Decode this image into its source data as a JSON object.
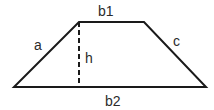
{
  "diagram": {
    "shape": "trapezoid",
    "vertices": {
      "top_left": [
        79,
        22
      ],
      "top_right": [
        144,
        22
      ],
      "bottom_right": [
        206,
        87
      ],
      "bottom_left": [
        14,
        87
      ]
    },
    "height_line": {
      "from": [
        79,
        22
      ],
      "to": [
        79,
        87
      ],
      "style": "dashed"
    },
    "labels": {
      "top_base": "b1",
      "bottom_base": "b2",
      "left_side": "a",
      "right_side": "c",
      "height": "h"
    },
    "colors": {
      "stroke": "#1a1a1a",
      "text": "#2b2b2b",
      "background": "#ffffff"
    }
  }
}
